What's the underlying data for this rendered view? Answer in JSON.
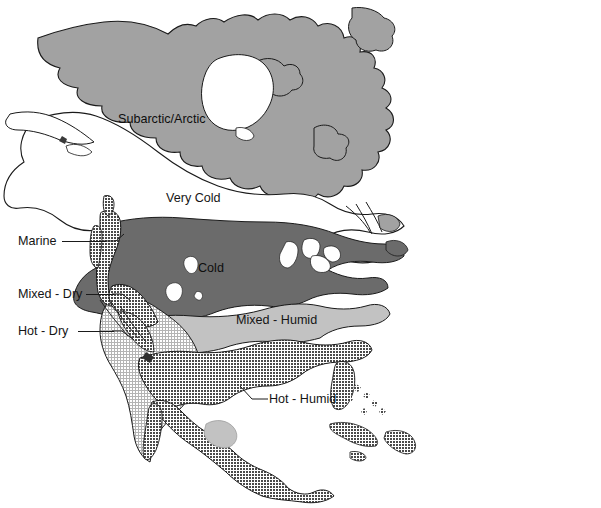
{
  "figure": {
    "label_prefix": "Figure",
    "label_number": "3.20",
    "caption_lines": [
      "The building science community and the U.S.",
      "Department of Energy produce design guidelines",
      "related to climatic zones to assist and encourage the",
      "design of climate-tuned, high performance houses."
    ]
  },
  "map": {
    "title": "Climate zones of North America",
    "zone_labels": [
      {
        "name": "subarctic-arctic",
        "text": "Subarctic/Arctic"
      },
      {
        "name": "very-cold",
        "text": "Very Cold"
      },
      {
        "name": "cold",
        "text": "Cold"
      },
      {
        "name": "mixed-humid",
        "text": "Mixed - Humid"
      }
    ],
    "callout_labels": [
      {
        "name": "marine",
        "text": "Marine"
      },
      {
        "name": "mixed-dry",
        "text": "Mixed - Dry"
      },
      {
        "name": "hot-dry",
        "text": "Hot - Dry"
      },
      {
        "name": "hot-humid",
        "text": "Hot - Humid"
      }
    ],
    "zone_fills": {
      "subarctic_arctic": "#a2a2a2",
      "very_cold": "#ffffff",
      "cold": "#6b6b6b",
      "mixed_humid": "#c2c2c2",
      "marine": "#707070",
      "mixed_dry": "#707070",
      "hot_dry": "#d9d9d9",
      "hot_humid": "#6e6e6e",
      "outline": "#1a1a1a",
      "water": "#ffffff"
    }
  }
}
